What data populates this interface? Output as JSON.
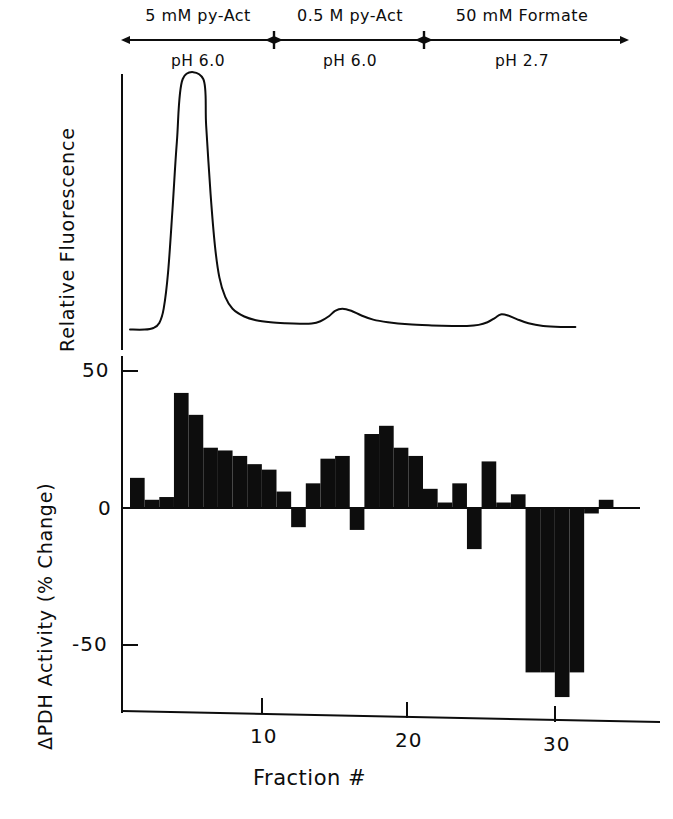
{
  "figure": {
    "background_color": "#ffffff",
    "ink_color": "#0d0d0d"
  },
  "gradient_header": {
    "segments": [
      {
        "name": "5 mM py-Act",
        "ph": "pH 6.0",
        "start_fraction": 1,
        "end_fraction": 10.8
      },
      {
        "name": "0.5 M py-Act",
        "ph": "pH 6.0",
        "start_fraction": 10.8,
        "end_fraction": 21.0
      },
      {
        "name": "50 mM Formate",
        "ph": "pH 2.7",
        "start_fraction": 21.0,
        "end_fraction": 31.5
      }
    ]
  },
  "fluorescence_panel": {
    "y_axis_title": "Relative Fluorescence"
  },
  "activity_panel": {
    "y_axis_title": "ΔPDH Activity (% Change)",
    "x_axis_title": "Fraction #",
    "y_ticks": [
      "50",
      "0",
      "-50"
    ],
    "x_ticks": [
      "10",
      "20",
      "30"
    ]
  },
  "chart_data": [
    {
      "type": "line",
      "title": "Relative Fluorescence elution profile",
      "xlabel": "Fraction #",
      "ylabel": "Relative Fluorescence",
      "xlim": [
        0.5,
        31.5
      ],
      "ylim": [
        0,
        100
      ],
      "grid": false,
      "legend": "none",
      "annotations": [
        "Large saturated flat-topped peak eluting in 5 mM py-Act pH 6.0 (fractions 4-6)",
        "Small peak eluting in 0.5 M py-Act pH 6.0 (fraction ~15)",
        "Small peak eluting in 50 mM Formate pH 2.7 (fraction ~26)"
      ],
      "series": [
        {
          "name": "Relative Fluorescence",
          "x": [
            1.0,
            2.0,
            2.6,
            3.0,
            3.3,
            3.6,
            3.9,
            4.2,
            4.6,
            6.0,
            6.2,
            6.5,
            6.8,
            7.1,
            7.5,
            8.0,
            8.8,
            9.6,
            10.6,
            11.6,
            12.6,
            13.4,
            14.0,
            14.6,
            15.0,
            15.5,
            16.1,
            16.8,
            17.6,
            18.6,
            20.0,
            21.6,
            23.0,
            24.0,
            24.8,
            25.4,
            25.9,
            26.3,
            26.8,
            27.4,
            28.2,
            29.2,
            30.4,
            31.4
          ],
          "y": [
            4.0,
            4.0,
            4.6,
            6.5,
            12.0,
            26.0,
            50.0,
            76.0,
            100.0,
            100.0,
            82.0,
            56.0,
            36.0,
            24.0,
            16.5,
            12.0,
            9.0,
            7.6,
            6.8,
            6.4,
            6.2,
            6.3,
            7.2,
            9.2,
            11.2,
            12.0,
            11.2,
            9.4,
            7.8,
            6.8,
            6.0,
            5.6,
            5.4,
            5.4,
            5.8,
            6.8,
            8.4,
            9.8,
            9.4,
            8.0,
            6.4,
            5.4,
            5.0,
            5.0
          ]
        }
      ]
    },
    {
      "type": "bar",
      "title": "ΔPDH Activity per fraction",
      "xlabel": "Fraction #",
      "ylabel": "ΔPDH Activity (% Change)",
      "xlim": [
        0.5,
        31.5
      ],
      "ylim": [
        -75,
        55
      ],
      "yticks": [
        50,
        0,
        -50
      ],
      "xticks": [
        10,
        20,
        30
      ],
      "grid": false,
      "legend": "none",
      "categories": [
        1,
        2,
        3,
        4,
        5,
        6,
        7,
        8,
        9,
        10,
        11,
        12,
        13,
        14,
        15,
        16,
        17,
        18,
        19,
        20,
        21,
        22,
        23,
        24,
        25,
        26,
        27,
        28,
        29,
        30,
        31
      ],
      "values": [
        11,
        3,
        4,
        42,
        34,
        22,
        21,
        19,
        16,
        14,
        6,
        -7,
        9,
        18,
        19,
        -8,
        27,
        30,
        22,
        19,
        7,
        2,
        9,
        -15,
        17,
        2,
        5,
        -60,
        -60,
        -69,
        -60,
        -2,
        3
      ],
      "series": [
        {
          "name": "ΔPDH Activity (% Change)",
          "values": [
            11,
            3,
            4,
            42,
            34,
            22,
            21,
            19,
            16,
            14,
            6,
            -7,
            9,
            18,
            19,
            -8,
            27,
            30,
            22,
            19,
            7,
            2,
            9,
            -15,
            17,
            2,
            5,
            -60,
            -60,
            -69,
            -60,
            -2,
            3
          ]
        }
      ]
    }
  ]
}
